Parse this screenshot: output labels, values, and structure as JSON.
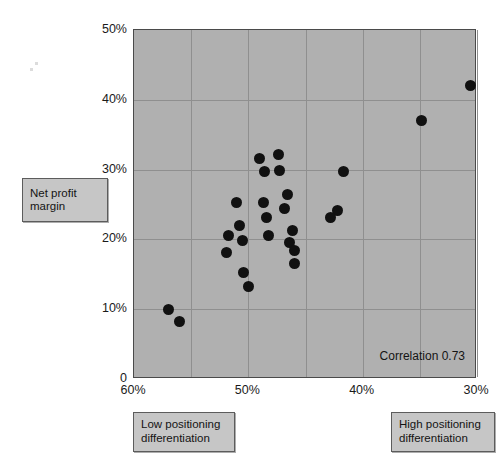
{
  "chart_data": {
    "type": "scatter",
    "title": "",
    "xlabel": "Positioning differentiation",
    "ylabel": "Net profit margin",
    "xlim": [
      60,
      30
    ],
    "ylim": [
      0,
      50
    ],
    "x_axis_reversed": true,
    "grid": true,
    "legend": null,
    "x_ticks": [
      "60%",
      "50%",
      "40%",
      "30%"
    ],
    "x_tick_values": [
      60,
      50,
      40,
      30
    ],
    "y_ticks": [
      "50%",
      "40%",
      "30%",
      "20%",
      "10%",
      "0"
    ],
    "y_tick_values": [
      50,
      40,
      30,
      20,
      10,
      0
    ],
    "annotation": "Correlation 0.73",
    "correlation": 0.73,
    "point_color": "#111111",
    "plot_background": "#b0b0b0",
    "points": [
      {
        "x": 57.0,
        "y": 10.0
      },
      {
        "x": 56.0,
        "y": 8.3
      },
      {
        "x": 51.9,
        "y": 18.1
      },
      {
        "x": 51.7,
        "y": 20.5
      },
      {
        "x": 51.0,
        "y": 25.3
      },
      {
        "x": 50.8,
        "y": 22.0
      },
      {
        "x": 50.5,
        "y": 19.9
      },
      {
        "x": 50.4,
        "y": 15.3
      },
      {
        "x": 50.0,
        "y": 13.2
      },
      {
        "x": 49.0,
        "y": 31.6
      },
      {
        "x": 48.6,
        "y": 29.8
      },
      {
        "x": 48.7,
        "y": 25.3
      },
      {
        "x": 48.4,
        "y": 23.1
      },
      {
        "x": 48.2,
        "y": 20.5
      },
      {
        "x": 47.4,
        "y": 32.1
      },
      {
        "x": 47.3,
        "y": 29.9
      },
      {
        "x": 46.6,
        "y": 26.4
      },
      {
        "x": 46.8,
        "y": 24.4
      },
      {
        "x": 46.1,
        "y": 21.3
      },
      {
        "x": 46.4,
        "y": 19.6
      },
      {
        "x": 46.0,
        "y": 18.4
      },
      {
        "x": 46.0,
        "y": 16.6
      },
      {
        "x": 41.7,
        "y": 29.8
      },
      {
        "x": 42.2,
        "y": 24.2
      },
      {
        "x": 42.8,
        "y": 23.1
      },
      {
        "x": 34.9,
        "y": 37.0
      },
      {
        "x": 30.6,
        "y": 42.1
      }
    ]
  },
  "callouts": {
    "y_axis": "Net profit\nmargin",
    "y_axis_line1": "Net profit",
    "y_axis_line2": "margin",
    "low_line1": "Low positioning",
    "low_line2": "differentiation",
    "high_line1": "High positioning",
    "high_line2": "differentiation"
  },
  "annotation_text": "Correlation 0.73"
}
